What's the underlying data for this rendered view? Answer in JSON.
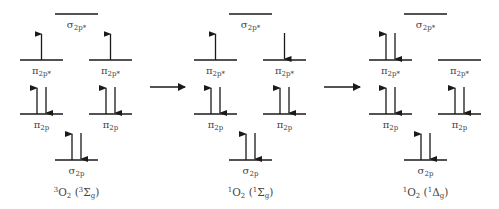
{
  "level_labels": {
    "sigma_star": {
      "symbol": "σ",
      "sub": "2p*"
    },
    "pi_star": {
      "symbol": "π",
      "sub": "2p*"
    },
    "pi": {
      "symbol": "π",
      "sub": "2p"
    },
    "sigma": {
      "symbol": "σ",
      "sub": "2p"
    }
  },
  "diagrams": [
    {
      "id": "triplet",
      "caption": {
        "pre_sup": "3",
        "mol": "O",
        "mol_sub": "2",
        "term_sup": "3",
        "term": "Σ",
        "term_sub": "g"
      },
      "occupancy": {
        "sigma_star": "empty",
        "pi_star_left": "up",
        "pi_star_right": "up",
        "pi_left": "pair",
        "pi_right": "pair",
        "sigma": "pair"
      }
    },
    {
      "id": "singlet-sigma",
      "caption": {
        "pre_sup": "1",
        "mol": "O",
        "mol_sub": "2",
        "term_sup": "1",
        "term": "Σ",
        "term_sub": "g"
      },
      "occupancy": {
        "sigma_star": "empty",
        "pi_star_left": "up",
        "pi_star_right": "down",
        "pi_left": "pair",
        "pi_right": "pair",
        "sigma": "pair"
      }
    },
    {
      "id": "singlet-delta",
      "caption": {
        "pre_sup": "1",
        "mol": "O",
        "mol_sub": "2",
        "term_sup": "1",
        "term": "Δ",
        "term_sub": "g"
      },
      "occupancy": {
        "sigma_star": "empty",
        "pi_star_left": "pair",
        "pi_star_right": "empty",
        "pi_left": "pair",
        "pi_right": "pair",
        "sigma": "pair"
      }
    }
  ],
  "transitions": [
    {
      "from": "triplet",
      "to": "singlet-sigma",
      "direction": "right"
    },
    {
      "from": "singlet-sigma",
      "to": "singlet-delta",
      "direction": "right"
    }
  ],
  "colors": {
    "line": "#1a1a1a",
    "label": "#444444"
  }
}
